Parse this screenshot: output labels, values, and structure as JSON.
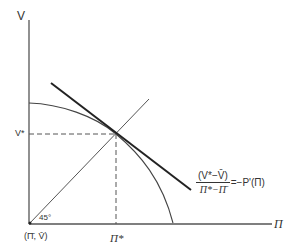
{
  "diagram": {
    "type": "economics-tangency-diagram",
    "y_axis_label": "V",
    "x_axis_label": "Π",
    "origin_label": "(Π̄, V̄)",
    "angle_label": "45°",
    "v_star_label": "V*",
    "pi_star_label": "Π*",
    "equation": {
      "numerator": "(V*−V̄)",
      "denominator": "Π*−Π̄",
      "rhs": "=−P'(Π)"
    },
    "elements": [
      {
        "name": "frontier-curve",
        "description": "concave frontier from V-axis to Π-axis"
      },
      {
        "name": "tangent-line",
        "description": "thick line tangent to frontier at (Π*, V*)"
      },
      {
        "name": "45-degree-line",
        "description": "ray from origin at 45°"
      },
      {
        "name": "dashed-guides",
        "description": "dashed lines from tangency point to axes"
      }
    ],
    "colors": {
      "line": "#333333",
      "background": "#ffffff"
    }
  }
}
